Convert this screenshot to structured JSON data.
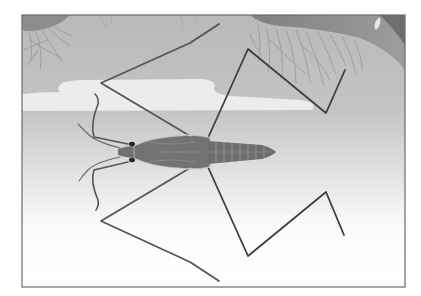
{
  "figure": {
    "palette": {
      "frame": "#6b6b6b",
      "shore_dark": "#8e8e8e",
      "shore_mid": "#a9a9a9",
      "water_top": "#bdbdbd",
      "reflection_band": "#ececec",
      "water_bottom": "#ffffff",
      "roots": "#9a9a9a",
      "leg": "#4a4a4a",
      "body": "#6f6f6f",
      "body_light": "#9a9a9a",
      "eye": "#262626"
    }
  }
}
